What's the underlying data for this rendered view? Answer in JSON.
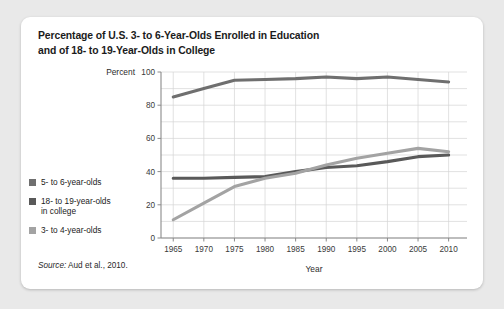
{
  "figure": {
    "title_line1": "Percentage of U.S. 3- to 6-Year-Olds Enrolled in Education",
    "title_line2": "and of 18- to 19-Year-Olds in College",
    "source": "Aud et al., 2010.",
    "source_word": "Source:"
  },
  "legend": {
    "items": [
      {
        "label": "5- to 6-year-olds",
        "color": "#6f6f6f"
      },
      {
        "label": "18- to 19-year-olds\nin college",
        "color": "#595959"
      },
      {
        "label": "3- to 4-year-olds",
        "color": "#a3a3a3"
      }
    ]
  },
  "chart_data": {
    "type": "line",
    "title": "Percentage of U.S. 3- to 6-Year-Olds Enrolled in Education and of 18- to 19-Year-Olds in College",
    "xlabel": "Year",
    "ylabel": "Percent",
    "xlim": [
      1963,
      2013
    ],
    "ylim": [
      0,
      100
    ],
    "xticks": [
      1965,
      1970,
      1975,
      1980,
      1985,
      1990,
      1995,
      2000,
      2005,
      2010
    ],
    "yticks": [
      0,
      20,
      40,
      60,
      80,
      100
    ],
    "gridline_step": 10,
    "grid": true,
    "legend_position": "left-outside",
    "x": [
      1965,
      1970,
      1975,
      1980,
      1985,
      1990,
      1995,
      2000,
      2005,
      2010
    ],
    "series": [
      {
        "name": "5- to 6-year-olds",
        "color": "#6f6f6f",
        "values": [
          85,
          90,
          95,
          95.5,
          96,
          97,
          96,
          97,
          95.5,
          94
        ]
      },
      {
        "name": "18- to 19-year-olds in college",
        "color": "#595959",
        "values": [
          36,
          36,
          36.5,
          37,
          40,
          42.5,
          43.5,
          46,
          49,
          50
        ]
      },
      {
        "name": "3- to 4-year-olds",
        "color": "#a3a3a3",
        "values": [
          11,
          21,
          31,
          36,
          39,
          44,
          48,
          51,
          54,
          52
        ]
      }
    ]
  }
}
